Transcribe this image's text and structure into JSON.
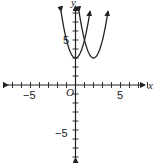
{
  "chart_data": {
    "type": "line",
    "title": "",
    "xlabel": "x",
    "ylabel": "y",
    "xlim": [
      -8,
      8
    ],
    "ylim": [
      -9,
      9
    ],
    "grid": false,
    "origin_label": "O",
    "x_ticks": [
      -8,
      -7,
      -6,
      -5,
      -4,
      -3,
      -2,
      -1,
      1,
      2,
      3,
      4,
      5,
      6,
      7,
      8
    ],
    "y_ticks": [
      -8,
      -7,
      -6,
      -5,
      -4,
      -3,
      -2,
      -1,
      1,
      2,
      3,
      4,
      5,
      6,
      7,
      8
    ],
    "x_tick_labels": [
      {
        "value": -5,
        "text": "−5"
      },
      {
        "value": 5,
        "text": "5"
      }
    ],
    "y_tick_labels": [
      {
        "value": 5,
        "text": "5"
      },
      {
        "value": -5,
        "text": "−5"
      }
    ],
    "series": [
      {
        "name": "parabola 1",
        "equation": "y = 2x² + 3",
        "vertex": [
          0,
          3
        ],
        "color": "#222222"
      },
      {
        "name": "parabola 2",
        "equation": "y = 2(x − 2)² + 3",
        "vertex": [
          2,
          3
        ],
        "color": "#222222"
      }
    ]
  },
  "labels": {
    "x_axis": "x",
    "y_axis": "y",
    "origin": "O",
    "x_neg5": "−5",
    "x_pos5": "5",
    "y_pos5": "5",
    "y_neg5": "−5"
  }
}
